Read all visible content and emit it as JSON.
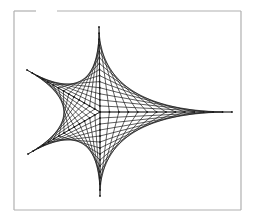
{
  "figure": {
    "background": "#ffffff",
    "line_color": "#1a1a1a",
    "frame_color": "#b0b0b0",
    "frame": {
      "left": 14,
      "top": 11,
      "right": 241,
      "bottom": 210,
      "top_gap": [
        36,
        57
      ]
    },
    "center": [
      100,
      112
    ],
    "spokes": [
      {
        "name": "top",
        "end": [
          99,
          27
        ]
      },
      {
        "name": "upper-left",
        "end": [
          27,
          70
        ]
      },
      {
        "name": "lower-left",
        "end": [
          28,
          154
        ]
      },
      {
        "name": "bottom",
        "end": [
          100,
          196
        ]
      },
      {
        "name": "right",
        "end": [
          232,
          112
        ]
      }
    ],
    "points_per_spoke": 14
  }
}
